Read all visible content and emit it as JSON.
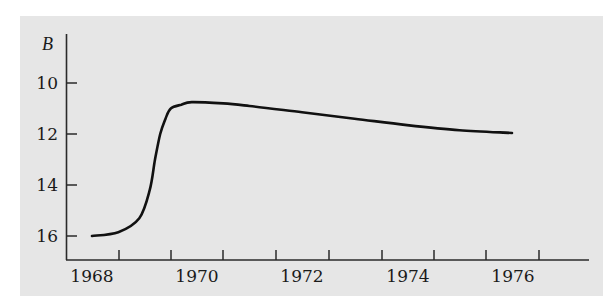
{
  "chart_data": {
    "type": "line",
    "title": "",
    "xlabel": "",
    "ylabel": "B",
    "y_inverted": true,
    "xlim": [
      1967.5,
      1977.4
    ],
    "ylim": [
      17,
      9
    ],
    "x_tick_labels": [
      "1968",
      "1970",
      "1972",
      "1974",
      "1976"
    ],
    "y_tick_labels": [
      "10",
      "12",
      "14",
      "16"
    ],
    "grid": false,
    "legend": null,
    "series": [
      {
        "name": "B",
        "x": [
          1968.0,
          1968.5,
          1968.9,
          1969.1,
          1969.2,
          1969.3,
          1969.4,
          1969.5,
          1969.7,
          1969.9,
          1970.5,
          1971.0,
          1972.0,
          1973.0,
          1974.0,
          1975.0,
          1976.0
        ],
        "y": [
          16.0,
          15.85,
          15.3,
          14.2,
          13.0,
          12.0,
          11.4,
          11.0,
          10.85,
          10.75,
          10.8,
          10.9,
          11.15,
          11.4,
          11.65,
          11.85,
          11.96
        ]
      }
    ]
  },
  "axis": {
    "y_label": "B",
    "y_ticks": [
      "10",
      "12",
      "14",
      "16"
    ],
    "x_ticks": [
      "1968",
      "1970",
      "1972",
      "1974",
      "1976"
    ]
  }
}
